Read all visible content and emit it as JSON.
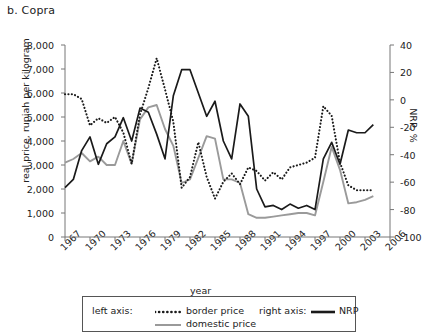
{
  "chart_data": {
    "type": "line",
    "title": "b. Copra",
    "xlabel": "year",
    "ylabel_left": "real price, rupiah per kilogram",
    "ylabel_right": "NRP, %",
    "grid": false,
    "legend_position": "bottom",
    "xlim": [
      1967,
      2006
    ],
    "ylim_left": [
      0,
      8000
    ],
    "ylim_right": [
      -100,
      40
    ],
    "xticks": [
      "1967",
      "1970",
      "1973",
      "1976",
      "1979",
      "1982",
      "1985",
      "1988",
      "1991",
      "1994",
      "1997",
      "2000",
      "2003",
      "2006"
    ],
    "yticks_left": [
      "0",
      "1,000",
      "2,000",
      "3,000",
      "4,000",
      "5,000",
      "6,000",
      "7,000",
      "8,000"
    ],
    "yticks_right": [
      "-100",
      "-80",
      "-60",
      "-40",
      "-20",
      "0",
      "20",
      "40"
    ],
    "x": [
      1967,
      1968,
      1969,
      1970,
      1971,
      1972,
      1973,
      1974,
      1975,
      1976,
      1977,
      1978,
      1979,
      1980,
      1981,
      1982,
      1983,
      1984,
      1985,
      1986,
      1987,
      1988,
      1989,
      1990,
      1991,
      1992,
      1993,
      1994,
      1995,
      1996,
      1997,
      1998,
      1999,
      2000,
      2001,
      2002,
      2003,
      2004
    ],
    "series": [
      {
        "name": "border price",
        "axis": "left",
        "style": "dotted",
        "color": "#1a1a1a",
        "values": [
          5950,
          5950,
          5750,
          4650,
          4950,
          4750,
          5000,
          4350,
          3050,
          5100,
          6200,
          7450,
          6150,
          4800,
          2050,
          2500,
          3950,
          2500,
          1600,
          2300,
          2650,
          2200,
          2900,
          2750,
          2350,
          2700,
          2400,
          2900,
          3000,
          3100,
          3300,
          5450,
          5050,
          3100,
          2150,
          1950,
          1950,
          1950
        ]
      },
      {
        "name": "domestic price",
        "axis": "left",
        "style": "solid",
        "color": "#9a9a9a",
        "values": [
          3100,
          3250,
          3500,
          3150,
          3350,
          3000,
          3000,
          4000,
          3050,
          4900,
          5400,
          5500,
          4500,
          3800,
          2250,
          2400,
          3300,
          4200,
          4100,
          2400,
          2400,
          2250,
          950,
          800,
          800,
          850,
          900,
          950,
          1000,
          1000,
          900,
          2300,
          3750,
          2800,
          1400,
          1450,
          1550,
          1700
        ]
      },
      {
        "name": "NRP",
        "axis": "right",
        "style": "solid-bold",
        "color": "#1a1a1a",
        "values": [
          -64,
          -58,
          -37,
          -27,
          -47,
          -32,
          -27,
          -13,
          -30,
          -6,
          -9,
          -25,
          -43,
          3,
          22,
          22,
          5,
          -12,
          -1,
          -30,
          -43,
          -3,
          -12,
          -65,
          -78,
          -77,
          -80,
          -76,
          -79,
          -77,
          -80,
          -43,
          -31,
          -47,
          -22,
          -24,
          -24,
          -18
        ]
      }
    ],
    "legend": {
      "left_axis_label": "left axis:",
      "right_axis_label": "right axis:",
      "entries": [
        "border price",
        "domestic price",
        "NRP"
      ]
    }
  }
}
